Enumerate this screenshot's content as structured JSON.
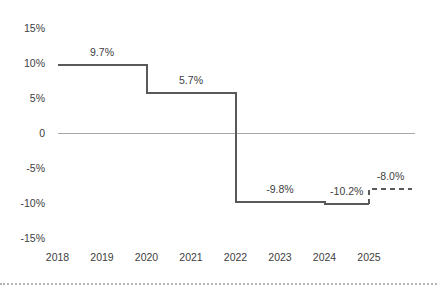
{
  "chart_data": {
    "type": "line",
    "subtype": "step",
    "unit": "%",
    "title": "",
    "xlabel": "",
    "ylabel": "",
    "x_ticks": [
      "2018",
      "2019",
      "2020",
      "2021",
      "2022",
      "2023",
      "2024",
      "2025"
    ],
    "y_ticks": [
      {
        "label": "15%",
        "value": 15
      },
      {
        "label": "10%",
        "value": 10
      },
      {
        "label": "5%",
        "value": 5
      },
      {
        "label": "0",
        "value": 0
      },
      {
        "label": "-5%",
        "value": -5
      },
      {
        "label": "-10%",
        "value": -10
      },
      {
        "label": "-15%",
        "value": -15
      }
    ],
    "ylim": [
      -17,
      17
    ],
    "grid": "zero-line-only",
    "legend": "none",
    "steps": [
      {
        "from": 2018,
        "to": 2020,
        "value": 9.7,
        "label": "9.7%",
        "style": "solid"
      },
      {
        "from": 2020,
        "to": 2022,
        "value": 5.7,
        "label": "5.7%",
        "style": "solid"
      },
      {
        "from": 2022,
        "to": 2024,
        "value": -9.8,
        "label": "-9.8%",
        "style": "solid"
      },
      {
        "from": 2024,
        "to": 2025,
        "value": -10.2,
        "label": "-10.2%",
        "style": "solid"
      },
      {
        "from": 2025,
        "to": 2025.97,
        "value": -8.0,
        "label": "-8.0%",
        "style": "dashed"
      }
    ],
    "colors": {
      "line": "#595959",
      "dashed_line": "#595959",
      "zero_line": "#a9a9a9",
      "text": "#404040",
      "separator": "#b4b4b4",
      "background": "#ffffff"
    }
  }
}
